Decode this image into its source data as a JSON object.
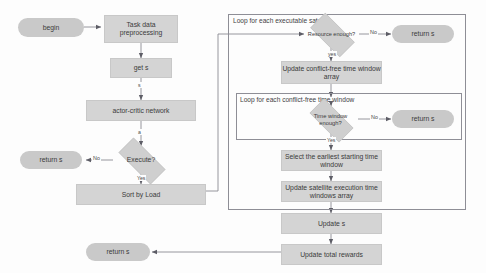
{
  "diagram": {
    "colors": {
      "process_fill": "#d4d4d4",
      "terminator_fill": "#c9c9c9",
      "decision_fill": "#cfcfcf",
      "loop_border": "#8e8e96",
      "wire": "#7c7c84",
      "text": "#3b3b3b",
      "background": "#fdfdfd"
    },
    "nodes": {
      "begin": "begin",
      "task_data_preprocessing": "Task data preprocessing",
      "get_s": "get s",
      "actor_critic_network": "actor-critic network",
      "execute_decision": "Execute?",
      "return_s_execute_no": "return s",
      "sort_by_load": "Sort by Load",
      "resource_enough_decision": "Resource enough?",
      "return_s_resource_no": "return s",
      "update_conflict_free_time_window_array": "Update conflict-free time window array",
      "time_window_enough_decision": "Time window enough?",
      "return_s_time_window_no": "return s",
      "select_earliest_starting_time_window": "Select the earliest starting time window",
      "update_satellite_execution_time_windows_array": "Update  satellite execution time windows array",
      "update_s": "Update s",
      "update_total_rewards": "Update total rewards",
      "return_s_final": "return s"
    },
    "loops": {
      "outer_label": "Loop for each executable satellite",
      "inner_label": "Loop for each conflict-free time window"
    },
    "edge_labels": {
      "state_s": "s",
      "action_a": "a",
      "execute_no": "No",
      "execute_yes": "Yes",
      "resource_no": "No",
      "resource_yes": "yes",
      "time_window_no": "No",
      "time_window_yes": "Yes"
    }
  }
}
